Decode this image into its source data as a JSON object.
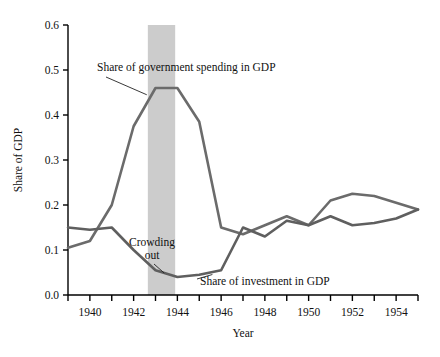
{
  "chart_data": {
    "type": "line",
    "title": "",
    "xlabel": "Year",
    "ylabel": "Share of GDP",
    "xlim": [
      1939,
      1955
    ],
    "ylim": [
      0.0,
      0.6
    ],
    "grid": false,
    "legend_position": "inline-annotations",
    "x": [
      1939,
      1940,
      1941,
      1942,
      1943,
      1944,
      1945,
      1946,
      1947,
      1948,
      1949,
      1950,
      1951,
      1952,
      1953,
      1954,
      1955
    ],
    "xticks": [
      1940,
      1942,
      1944,
      1946,
      1948,
      1950,
      1952,
      1954
    ],
    "xtick_labels": [
      "1940",
      "1942",
      "1944",
      "1946",
      "1948",
      "1950",
      "1952",
      "1954"
    ],
    "yticks": [
      0.0,
      0.1,
      0.2,
      0.3,
      0.4,
      0.5,
      0.6
    ],
    "ytick_labels": [
      "0.0",
      "0.1",
      "0.2",
      "0.3",
      "0.4",
      "0.5",
      "0.6"
    ],
    "series": [
      {
        "name": "Share of government spending in GDP",
        "color": "#6b6b6b",
        "values": [
          0.105,
          0.12,
          0.2,
          0.375,
          0.46,
          0.46,
          0.385,
          0.15,
          0.135,
          0.155,
          0.175,
          0.155,
          0.21,
          0.225,
          0.22,
          0.205,
          0.19
        ]
      },
      {
        "name": "Share of investment in GDP",
        "color": "#5f5f5f",
        "values": [
          0.15,
          0.145,
          0.15,
          0.1,
          0.055,
          0.04,
          0.045,
          0.055,
          0.15,
          0.13,
          0.165,
          0.155,
          0.175,
          0.155,
          0.16,
          0.17,
          0.19
        ]
      }
    ],
    "annotations": [
      {
        "name": "government-spending-label",
        "text": "Share of government spending in GDP",
        "points_to_year": 1942.6,
        "points_to_value": 0.445
      },
      {
        "name": "crowding-out-label",
        "text_line1": "Crowding",
        "text_line2": "out",
        "points_to_year": 1943.4,
        "points_to_value": 0.042
      },
      {
        "name": "investment-label",
        "text": "Share of investment in GDP",
        "points_to_year": 1945.6,
        "points_to_value": 0.05
      }
    ],
    "shaded_band": {
      "name": "crowding-out-band",
      "from_year": 1942.65,
      "to_year": 1943.9,
      "color": "#cccccc"
    },
    "axis_color": "#000000",
    "background": "#ffffff"
  }
}
